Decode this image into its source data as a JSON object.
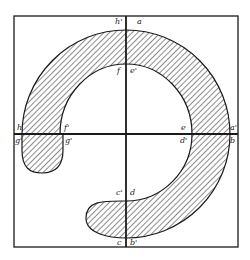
{
  "diagram": {
    "colors": {
      "ink": "#1a1a1a",
      "background": "#ffffff"
    },
    "labels": {
      "h_prime": "h'",
      "a": "a",
      "f": "f",
      "e_prime": "e'",
      "h": "h",
      "f_prime": "f'",
      "e": "e",
      "a_prime": "a'",
      "g_prime": "g'",
      "g_dprime": "g'",
      "d_prime": "d'",
      "b": "b",
      "c_prime": "c'",
      "d": "d",
      "c": "c",
      "b_prime": "b'"
    }
  }
}
